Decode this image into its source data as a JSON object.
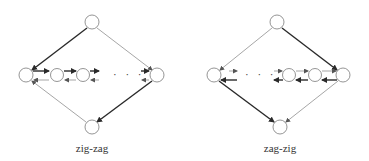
{
  "diagrams": [
    {
      "label": "zig-zag",
      "ellipsis": "· · ·",
      "nodes": [
        "top",
        "left",
        "chain-1",
        "chain-2",
        "right",
        "bottom"
      ],
      "heavy_path": "top → left → chain → right → bottom"
    },
    {
      "label": "zag-zig",
      "ellipsis": "· · ·",
      "nodes": [
        "top",
        "left",
        "chain-1",
        "chain-2",
        "right",
        "bottom"
      ],
      "heavy_path": "top → right → chain → left → bottom"
    }
  ],
  "colors": {
    "stroke": "#7a7a7a",
    "heavy": "#2a2a2a",
    "background": "#ffffff"
  }
}
